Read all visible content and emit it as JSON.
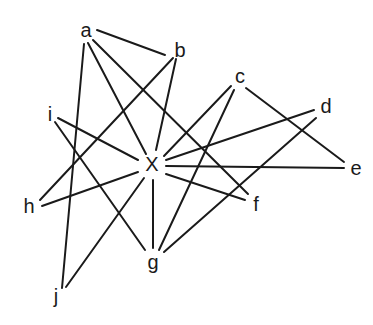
{
  "diagram": {
    "type": "graph",
    "nodes": [
      {
        "id": "a",
        "label": "a",
        "x": 86,
        "y": 30
      },
      {
        "id": "b",
        "label": "b",
        "x": 180,
        "y": 50
      },
      {
        "id": "c",
        "label": "c",
        "x": 240,
        "y": 76
      },
      {
        "id": "d",
        "label": "d",
        "x": 326,
        "y": 106
      },
      {
        "id": "e",
        "label": "e",
        "x": 356,
        "y": 168
      },
      {
        "id": "f",
        "label": "f",
        "x": 256,
        "y": 204
      },
      {
        "id": "g",
        "label": "g",
        "x": 153,
        "y": 262
      },
      {
        "id": "h",
        "label": "h",
        "x": 29,
        "y": 206
      },
      {
        "id": "i",
        "label": "i",
        "x": 50,
        "y": 114
      },
      {
        "id": "j",
        "label": "j",
        "x": 56,
        "y": 296
      },
      {
        "id": "X",
        "label": "X",
        "x": 152,
        "y": 164
      }
    ],
    "edges": [
      {
        "from": "a",
        "to": "b",
        "x1": 97,
        "y1": 30,
        "x2": 165,
        "y2": 55
      },
      {
        "from": "a",
        "to": "j",
        "x1": 84,
        "y1": 44,
        "x2": 62,
        "y2": 288
      },
      {
        "from": "a",
        "to": "X",
        "x1": 88,
        "y1": 43,
        "x2": 146,
        "y2": 154
      },
      {
        "from": "a",
        "to": "f",
        "x1": 93,
        "y1": 40,
        "x2": 248,
        "y2": 194
      },
      {
        "from": "b",
        "to": "h",
        "x1": 173,
        "y1": 58,
        "x2": 40,
        "y2": 200
      },
      {
        "from": "b",
        "to": "X",
        "x1": 176,
        "y1": 59,
        "x2": 156,
        "y2": 150
      },
      {
        "from": "c",
        "to": "X",
        "x1": 231,
        "y1": 86,
        "x2": 164,
        "y2": 156
      },
      {
        "from": "c",
        "to": "g",
        "x1": 234,
        "y1": 90,
        "x2": 159,
        "y2": 250
      },
      {
        "from": "c",
        "to": "e",
        "x1": 246,
        "y1": 88,
        "x2": 344,
        "y2": 162
      },
      {
        "from": "d",
        "to": "X",
        "x1": 314,
        "y1": 110,
        "x2": 166,
        "y2": 160
      },
      {
        "from": "d",
        "to": "g",
        "x1": 316,
        "y1": 118,
        "x2": 164,
        "y2": 252
      },
      {
        "from": "e",
        "to": "X",
        "x1": 344,
        "y1": 168,
        "x2": 166,
        "y2": 166
      },
      {
        "from": "f",
        "to": "X",
        "x1": 245,
        "y1": 200,
        "x2": 166,
        "y2": 174
      },
      {
        "from": "i",
        "to": "X",
        "x1": 58,
        "y1": 118,
        "x2": 138,
        "y2": 160
      },
      {
        "from": "i",
        "to": "g",
        "x1": 55,
        "y1": 122,
        "x2": 145,
        "y2": 250
      },
      {
        "from": "h",
        "to": "X",
        "x1": 42,
        "y1": 206,
        "x2": 138,
        "y2": 172
      },
      {
        "from": "j",
        "to": "X",
        "x1": 66,
        "y1": 287,
        "x2": 144,
        "y2": 178
      },
      {
        "from": "g",
        "to": "X",
        "x1": 153,
        "y1": 248,
        "x2": 153,
        "y2": 180
      }
    ]
  }
}
